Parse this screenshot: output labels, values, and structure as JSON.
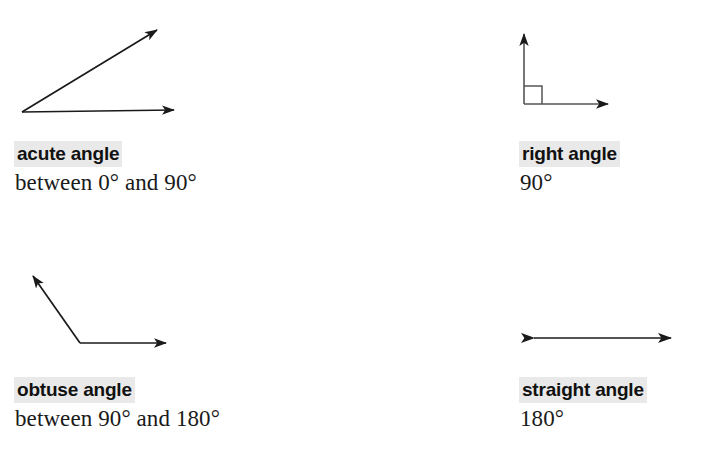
{
  "page": {
    "background_color": "#ffffff",
    "stroke_color": "#1a1a1a",
    "highlight_color": "#e9e9e9",
    "text_color": "#1a1a1a"
  },
  "angles": [
    {
      "id": "acute",
      "term": "acute angle",
      "description": "between 0° and 90°",
      "figure_name": "acute-angle-diagram",
      "measure_text": "between 0° and 90°",
      "min_degrees": 0,
      "max_degrees": 90
    },
    {
      "id": "right",
      "term": "right angle",
      "description": "90°",
      "figure_name": "right-angle-diagram",
      "measure_text": "90°",
      "min_degrees": 90,
      "max_degrees": 90
    },
    {
      "id": "obtuse",
      "term": "obtuse angle",
      "description": "between 90° and 180°",
      "figure_name": "obtuse-angle-diagram",
      "measure_text": "between 90° and 180°",
      "min_degrees": 90,
      "max_degrees": 180
    },
    {
      "id": "straight",
      "term": "straight angle",
      "description": "180°",
      "figure_name": "straight-angle-diagram",
      "measure_text": "180°",
      "min_degrees": 180,
      "max_degrees": 180
    }
  ]
}
